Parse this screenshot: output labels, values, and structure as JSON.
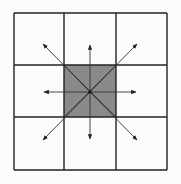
{
  "diagram": {
    "type": "grid-neighborhood",
    "grid": {
      "rows": 3,
      "cols": 3,
      "x0": 14,
      "y0": 13,
      "x1": 167,
      "y1": 170,
      "xs": [
        14,
        64,
        116,
        167
      ],
      "ys": [
        13,
        65,
        117,
        170
      ]
    },
    "center": {
      "x": 90,
      "y": 92
    },
    "center_cell_fill": "#8a8a8a",
    "line_color": "#222222",
    "arrow_color": "#333333",
    "arrows": [
      {
        "dir": "N",
        "x": 90,
        "y": 45
      },
      {
        "dir": "NE",
        "x": 137,
        "y": 44
      },
      {
        "dir": "E",
        "x": 136,
        "y": 92
      },
      {
        "dir": "SE",
        "x": 137,
        "y": 140
      },
      {
        "dir": "S",
        "x": 90,
        "y": 139
      },
      {
        "dir": "SW",
        "x": 43,
        "y": 140
      },
      {
        "dir": "W",
        "x": 44,
        "y": 92
      },
      {
        "dir": "NW",
        "x": 43,
        "y": 44
      }
    ]
  }
}
